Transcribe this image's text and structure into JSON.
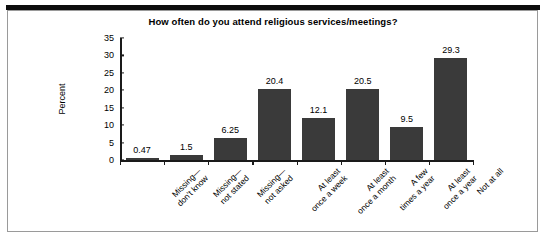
{
  "figure": {
    "title": "How often do you attend religious services/meetings?",
    "accent_color": "#3a3a3a",
    "axis_color": "#1a1a1a",
    "frame_color": "#9a9a9a",
    "rule_color": "#0d0d0d"
  },
  "chart_data": {
    "type": "bar",
    "title": "How often do you attend religious services/meetings?",
    "xlabel": "",
    "ylabel": "Percent",
    "ylim": [
      0,
      35
    ],
    "ytick_step": 5,
    "yticks": [
      0,
      5,
      10,
      15,
      20,
      25,
      30,
      35
    ],
    "grid": false,
    "legend": null,
    "categories": [
      "Missing—\ndon't know",
      "Missing—\nnot stated",
      "Missing—\nnot asked",
      "At least\nonce a week",
      "At least\nonce a month",
      "A few\ntimes a year",
      "At least\nonce a year",
      "Not at all"
    ],
    "category_lines": [
      [
        "Missing—",
        "don't know"
      ],
      [
        "Missing—",
        "not stated"
      ],
      [
        "Missing—",
        "not asked"
      ],
      [
        "At least",
        "once a week"
      ],
      [
        "At least",
        "once a month"
      ],
      [
        "A few",
        "times a year"
      ],
      [
        "At least",
        "once a year"
      ],
      [
        "Not at all",
        ""
      ]
    ],
    "values": [
      0.47,
      1.5,
      6.25,
      20.4,
      12.1,
      20.5,
      9.5,
      29.3
    ],
    "value_labels": [
      "0.47",
      "1.5",
      "6.25",
      "20.4",
      "12.1",
      "20.5",
      "9.5",
      "29.3"
    ],
    "bar_color": "#3a3a3a"
  }
}
